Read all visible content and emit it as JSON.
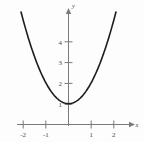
{
  "chart_data": {
    "type": "line",
    "title": "",
    "xlabel": "x",
    "ylabel": "y",
    "equation": "y = x^2 + 1",
    "xlim": [
      -2.45,
      2.65
    ],
    "ylim": [
      -0.45,
      5.6
    ],
    "xticks": [
      -2,
      -1,
      1,
      2
    ],
    "xticklabels": [
      "-2",
      "-1",
      "1",
      "2"
    ],
    "yticks": [
      1,
      2,
      3,
      4
    ],
    "yticklabels": [
      "1",
      "2",
      "3",
      "4"
    ],
    "grid": false,
    "legend": false,
    "series": [
      {
        "name": "y = x^2 + 1",
        "x": [
          -2.1,
          -1.9,
          -1.7,
          -1.5,
          -1.3,
          -1.1,
          -0.9,
          -0.7,
          -0.5,
          -0.3,
          -0.1,
          0.1,
          0.3,
          0.5,
          0.7,
          0.9,
          1.1,
          1.3,
          1.5,
          1.7,
          1.9,
          2.1
        ],
        "y": [
          5.41,
          4.61,
          3.89,
          3.25,
          2.69,
          2.21,
          1.81,
          1.49,
          1.25,
          1.09,
          1.01,
          1.01,
          1.09,
          1.25,
          1.49,
          1.81,
          2.21,
          2.69,
          3.25,
          3.89,
          4.61,
          5.41
        ]
      }
    ],
    "annotations": {
      "vertex": {
        "x": 0,
        "y": 1
      }
    },
    "colors": {
      "curve": "#1d1d1d",
      "axis": "#7a7a7a",
      "text": "#4a4a4a",
      "background": "#fdfdfd"
    }
  },
  "axis_labels": {
    "x": "x",
    "y": "y"
  }
}
